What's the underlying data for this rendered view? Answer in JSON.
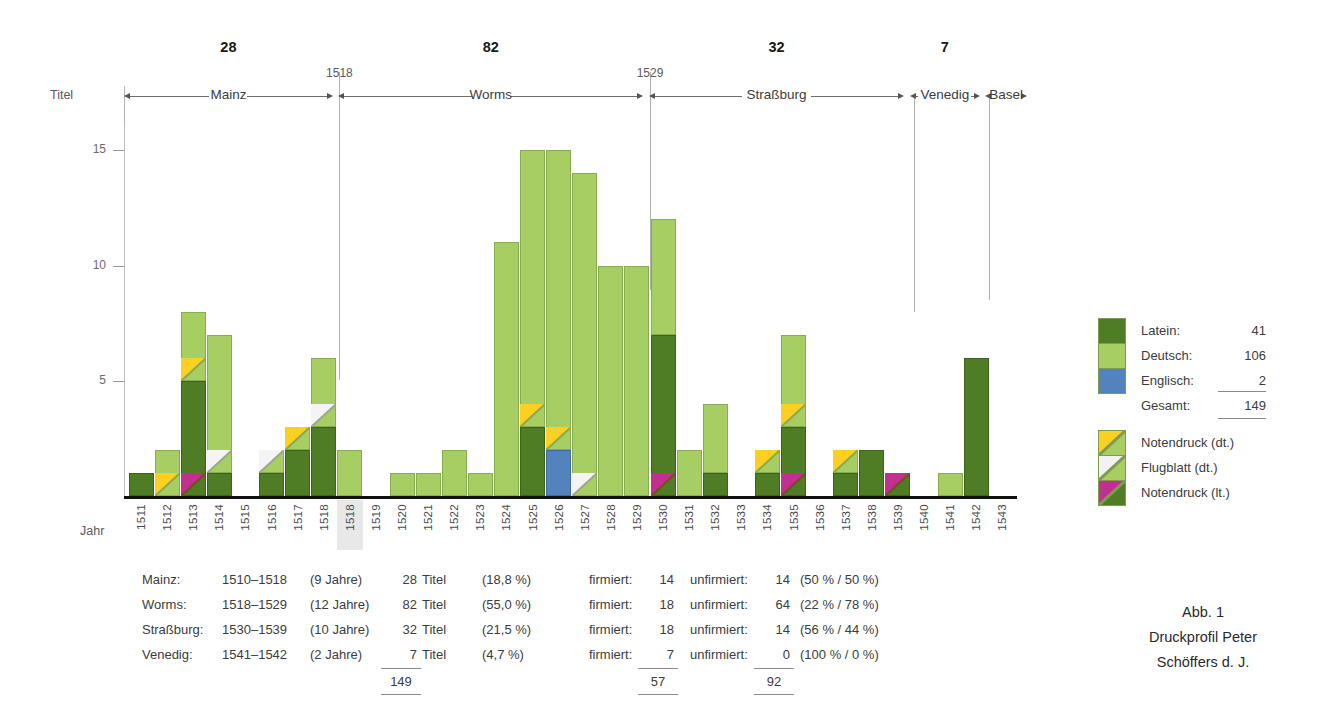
{
  "figure": {
    "caption_lines": [
      "Abb. 1",
      "Druckprofil Peter",
      "Schöffers d. J."
    ],
    "y_axis_label": "Titel",
    "x_axis_label": "Jahr",
    "highlighted_year": "1518"
  },
  "chart_data": {
    "type": "bar",
    "title": "Druckprofil Peter Schöffers d. J.",
    "xlabel": "Jahr",
    "ylabel": "Titel",
    "ylim": [
      0,
      16
    ],
    "yticks": [
      5,
      10,
      15
    ],
    "grid": false,
    "stacked": true,
    "legend_position": "right",
    "series": [
      {
        "name": "Latein",
        "color": "#4e7d25",
        "total": 41
      },
      {
        "name": "Deutsch",
        "color": "#a6ce62",
        "total": 106
      },
      {
        "name": "Englisch",
        "color": "#5283bd",
        "total": 2
      }
    ],
    "overlay_marks": [
      {
        "name": "Notendruck (dt.)",
        "color": "#fbd023",
        "on": "Deutsch"
      },
      {
        "name": "Flugblatt (dt.)",
        "color": "#f2f2f2",
        "on": "Deutsch"
      },
      {
        "name": "Notendruck (lt.)",
        "color": "#c0308e",
        "on": "Latein"
      }
    ],
    "categories": [
      "1511",
      "1512",
      "1513",
      "1514",
      "1515",
      "1516",
      "1517",
      "1518",
      "1518",
      "1519",
      "1520",
      "1521",
      "1522",
      "1523",
      "1524",
      "1525",
      "1526",
      "1527",
      "1528",
      "1529",
      "1530",
      "1531",
      "1532",
      "1533",
      "1534",
      "1535",
      "1536",
      "1537",
      "1538",
      "1539",
      "1540",
      "1541",
      "1542",
      "1543"
    ],
    "bars": [
      {
        "year": "1511",
        "col": 0,
        "latein": 1,
        "deutsch": 0,
        "englisch": 0,
        "total": 1,
        "marks": []
      },
      {
        "year": "1512",
        "col": 1,
        "latein": 0,
        "deutsch": 2,
        "englisch": 0,
        "total": 2,
        "marks": [
          "Notendruck (dt.)"
        ]
      },
      {
        "year": "1513",
        "col": 2,
        "latein": 5,
        "deutsch": 3,
        "englisch": 0,
        "total": 8,
        "marks": [
          "Notendruck (dt.)",
          "Notendruck (lt.)"
        ]
      },
      {
        "year": "1514",
        "col": 3,
        "latein": 1,
        "deutsch": 6,
        "englisch": 0,
        "total": 7,
        "marks": [
          "Flugblatt (dt.)"
        ]
      },
      {
        "year": "1515",
        "col": 4,
        "latein": 0,
        "deutsch": 0,
        "englisch": 0,
        "total": 0,
        "marks": []
      },
      {
        "year": "1516",
        "col": 5,
        "latein": 1,
        "deutsch": 1,
        "englisch": 0,
        "total": 2,
        "marks": [
          "Flugblatt (dt.)"
        ]
      },
      {
        "year": "1517",
        "col": 6,
        "latein": 2,
        "deutsch": 1,
        "englisch": 0,
        "total": 3,
        "marks": [
          "Notendruck (dt.)"
        ]
      },
      {
        "year": "1518",
        "col": 7,
        "latein": 3,
        "deutsch": 3,
        "englisch": 0,
        "total": 6,
        "marks": [
          "Flugblatt (dt.)"
        ]
      },
      {
        "year": "1518",
        "col": 8,
        "latein": 0,
        "deutsch": 2,
        "englisch": 0,
        "total": 2,
        "marks": []
      },
      {
        "year": "1519",
        "col": 9,
        "latein": 0,
        "deutsch": 0,
        "englisch": 0,
        "total": 0,
        "marks": []
      },
      {
        "year": "1520",
        "col": 10,
        "latein": 0,
        "deutsch": 1,
        "englisch": 0,
        "total": 1,
        "marks": []
      },
      {
        "year": "1521",
        "col": 11,
        "latein": 0,
        "deutsch": 1,
        "englisch": 0,
        "total": 1,
        "marks": []
      },
      {
        "year": "1522",
        "col": 12,
        "latein": 0,
        "deutsch": 2,
        "englisch": 0,
        "total": 2,
        "marks": []
      },
      {
        "year": "1523",
        "col": 13,
        "latein": 0,
        "deutsch": 1,
        "englisch": 0,
        "total": 1,
        "marks": []
      },
      {
        "year": "1524",
        "col": 14,
        "latein": 0,
        "deutsch": 11,
        "englisch": 0,
        "total": 11,
        "marks": []
      },
      {
        "year": "1525",
        "col": 15,
        "latein": 3,
        "deutsch": 12,
        "englisch": 0,
        "total": 15,
        "marks": [
          "Notendruck (dt.)"
        ]
      },
      {
        "year": "1526",
        "col": 16,
        "latein": 0,
        "deutsch": 13,
        "englisch": 2,
        "total": 15,
        "marks": [
          "Notendruck (dt.)"
        ]
      },
      {
        "year": "1527",
        "col": 17,
        "latein": 0,
        "deutsch": 14,
        "englisch": 0,
        "total": 14,
        "marks": [
          "Flugblatt (dt.)"
        ]
      },
      {
        "year": "1528",
        "col": 18,
        "latein": 0,
        "deutsch": 10,
        "englisch": 0,
        "total": 10,
        "marks": []
      },
      {
        "year": "1529",
        "col": 19,
        "latein": 0,
        "deutsch": 10,
        "englisch": 0,
        "total": 10,
        "marks": []
      },
      {
        "year": "1530",
        "col": 20,
        "latein": 7,
        "deutsch": 5,
        "englisch": 0,
        "total": 12,
        "marks": [
          "Notendruck (lt.)"
        ]
      },
      {
        "year": "1531",
        "col": 21,
        "latein": 0,
        "deutsch": 2,
        "englisch": 0,
        "total": 2,
        "marks": []
      },
      {
        "year": "1532",
        "col": 22,
        "latein": 1,
        "deutsch": 3,
        "englisch": 0,
        "total": 4,
        "marks": []
      },
      {
        "year": "1533",
        "col": 23,
        "latein": 0,
        "deutsch": 0,
        "englisch": 0,
        "total": 0,
        "marks": []
      },
      {
        "year": "1534",
        "col": 24,
        "latein": 1,
        "deutsch": 1,
        "englisch": 0,
        "total": 2,
        "marks": [
          "Notendruck (dt.)"
        ]
      },
      {
        "year": "1535",
        "col": 25,
        "latein": 3,
        "deutsch": 4,
        "englisch": 0,
        "total": 7,
        "marks": [
          "Notendruck (dt.)",
          "Notendruck (lt.)"
        ]
      },
      {
        "year": "1536",
        "col": 26,
        "latein": 0,
        "deutsch": 0,
        "englisch": 0,
        "total": 0,
        "marks": []
      },
      {
        "year": "1537",
        "col": 27,
        "latein": 1,
        "deutsch": 1,
        "englisch": 0,
        "total": 2,
        "marks": [
          "Notendruck (dt.)"
        ]
      },
      {
        "year": "1538",
        "col": 28,
        "latein": 2,
        "deutsch": 0,
        "englisch": 0,
        "total": 2,
        "marks": []
      },
      {
        "year": "1539",
        "col": 29,
        "latein": 1,
        "deutsch": 0,
        "englisch": 0,
        "total": 1,
        "marks": [
          "Notendruck (lt.)"
        ]
      },
      {
        "year": "1540",
        "col": 30,
        "latein": 0,
        "deutsch": 0,
        "englisch": 0,
        "total": 0,
        "marks": []
      },
      {
        "year": "1541",
        "col": 31,
        "latein": 0,
        "deutsch": 1,
        "englisch": 0,
        "total": 1,
        "marks": []
      },
      {
        "year": "1542",
        "col": 32,
        "latein": 6,
        "deutsch": 0,
        "englisch": 0,
        "total": 6,
        "marks": []
      },
      {
        "year": "1543",
        "col": 33,
        "latein": 0,
        "deutsch": 0,
        "englisch": 0,
        "total": 0,
        "marks": []
      }
    ],
    "periods": [
      {
        "name": "Mainz",
        "count": "28",
        "start_col": 0,
        "end_col": 8.0
      },
      {
        "name": "Worms",
        "count": "82",
        "start_col": 8.2,
        "end_col": 19.9
      },
      {
        "name": "Straßburg",
        "count": "32",
        "start_col": 20.1,
        "end_col": 29.9
      },
      {
        "name": "Venedig",
        "count": "7",
        "start_col": 30.1,
        "end_col": 32.8
      },
      {
        "name": "Basel",
        "count": "",
        "start_col": 33.0,
        "end_col": 34.6
      }
    ],
    "boundary_year_labels": [
      {
        "label": "1518",
        "col": 8.1
      },
      {
        "label": "1529",
        "col": 20.0
      }
    ]
  },
  "legend": {
    "language_items": [
      {
        "label": "Latein:",
        "value": "41",
        "color": "#4e7d25"
      },
      {
        "label": "Deutsch:",
        "value": "106",
        "color": "#a6ce62"
      },
      {
        "label": "Englisch:",
        "value": "2",
        "color": "#5283bd"
      }
    ],
    "total_label": "Gesamt:",
    "total_value": "149",
    "mark_items": [
      {
        "label": "Notendruck (dt.)",
        "color": "#fbd023",
        "base": "#a6ce62"
      },
      {
        "label": "Flugblatt (dt.)",
        "color": "#f2f2f2",
        "base": "#a6ce62"
      },
      {
        "label": "Notendruck (lt.)",
        "color": "#c0308e",
        "base": "#4e7d25"
      }
    ]
  },
  "summary_table": {
    "rows": [
      {
        "city": "Mainz:",
        "span": "1510–1518",
        "years": "(9 Jahre)",
        "titles": "28",
        "titles_unit": "Titel",
        "share": "(18,8 %)",
        "signed_label": "firmiert:",
        "signed": "14",
        "unsigned_label": "unfirmiert:",
        "unsigned": "14",
        "ratio": "(50 % / 50 %)"
      },
      {
        "city": "Worms:",
        "span": "1518–1529",
        "years": "(12 Jahre)",
        "titles": "82",
        "titles_unit": "Titel",
        "share": "(55,0 %)",
        "signed_label": "firmiert:",
        "signed": "18",
        "unsigned_label": "unfirmiert:",
        "unsigned": "64",
        "ratio": "(22 % / 78 %)"
      },
      {
        "city": "Straßburg:",
        "span": "1530–1539",
        "years": "(10 Jahre)",
        "titles": "32",
        "titles_unit": "Titel",
        "share": "(21,5 %)",
        "signed_label": "firmiert:",
        "signed": "18",
        "unsigned_label": "unfirmiert:",
        "unsigned": "14",
        "ratio": "(56 % / 44 %)"
      },
      {
        "city": "Venedig:",
        "span": "1541–1542",
        "years": "(2 Jahre)",
        "titles": "7",
        "titles_unit": "Titel",
        "share": "(4,7 %)",
        "signed_label": "firmiert:",
        "signed": "7",
        "unsigned_label": "unfirmiert:",
        "unsigned": "0",
        "ratio": "(100 % / 0 %)"
      }
    ],
    "totals": {
      "titles": "149",
      "signed": "57",
      "unsigned": "92"
    }
  }
}
